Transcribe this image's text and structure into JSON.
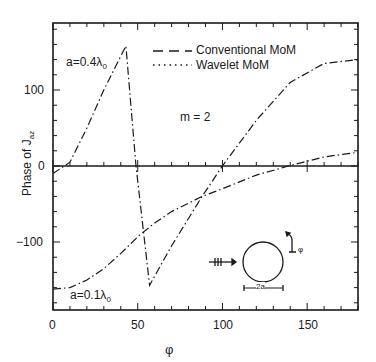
{
  "chart_data": {
    "type": "line",
    "title": "",
    "xlabel": "φ",
    "ylabel": "Phase of J_az",
    "xlim": [
      0,
      180
    ],
    "ylim": [
      -190,
      190
    ],
    "xticks": [
      0,
      50,
      100,
      150
    ],
    "yticks": [
      -100,
      0,
      100
    ],
    "grid": false,
    "legend": {
      "position": "upper center",
      "entries": [
        {
          "label": "Conventional MoM",
          "style": "dashed"
        },
        {
          "label": "Wavelet MoM",
          "style": "dotted"
        }
      ]
    },
    "annotations": [
      "m = 2",
      "a=0.4λ0",
      "a=0.1λ0",
      "2a",
      "φ"
    ],
    "series": [
      {
        "name": "a=0.4λ0",
        "x": [
          0,
          10,
          20,
          30,
          43,
          49,
          57,
          70,
          88,
          100,
          120,
          140,
          160,
          180
        ],
        "y": [
          -10,
          5,
          50,
          100,
          158,
          0,
          -157,
          -105,
          -40,
          0,
          60,
          110,
          135,
          140
        ]
      },
      {
        "name": "a=0.1λ0",
        "x": [
          0,
          10,
          20,
          30,
          40,
          51,
          60,
          70,
          88,
          100,
          120,
          139,
          160,
          180
        ],
        "y": [
          -162,
          -160,
          -150,
          -135,
          -115,
          -91,
          -75,
          -60,
          -40,
          -30,
          -12,
          0,
          12,
          18
        ]
      }
    ]
  },
  "labels": {
    "ylabel_main": "Phase of J",
    "ylabel_sub": "az",
    "xlabel": "φ",
    "legend_conv": "Conventional MoM",
    "legend_wave": "Wavelet MoM",
    "m_label": "m = 2",
    "a04": "a=0.4λ",
    "a01": "a=0.1λ",
    "sub0": "0",
    "tick_x0": "0",
    "tick_x50": "50",
    "tick_x100": "100",
    "tick_x150": "150",
    "tick_y100": "100",
    "tick_y0": "0",
    "tick_ym100": "−100",
    "inset_2a": "2a",
    "inset_phi": "φ"
  }
}
